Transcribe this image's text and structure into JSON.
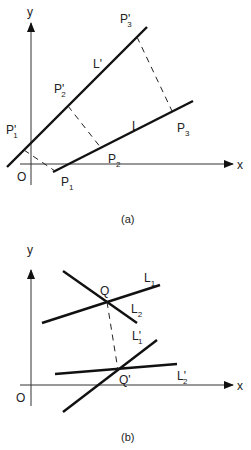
{
  "diagram_a": {
    "caption": "(a)",
    "axis_x_label": "x",
    "axis_y_label": "y",
    "origin_label": "O",
    "lines": [
      {
        "name": "L",
        "label": "L"
      },
      {
        "name": "L_prime",
        "label": "L",
        "prime": "'"
      }
    ],
    "points": [
      {
        "name": "P1",
        "main": "P",
        "sub": "1",
        "prime": ""
      },
      {
        "name": "P2",
        "main": "P",
        "sub": "2",
        "prime": ""
      },
      {
        "name": "P3",
        "main": "P",
        "sub": "3",
        "prime": ""
      },
      {
        "name": "P1_prime",
        "main": "P",
        "sub": "1",
        "prime": "'"
      },
      {
        "name": "P2_prime",
        "main": "P",
        "sub": "2",
        "prime": "'"
      },
      {
        "name": "P3_prime",
        "main": "P",
        "sub": "3",
        "prime": "'"
      }
    ]
  },
  "diagram_b": {
    "caption": "(b)",
    "axis_x_label": "x",
    "axis_y_label": "y",
    "origin_label": "O",
    "lines": [
      {
        "name": "L1",
        "main": "L",
        "sub": "1",
        "prime": ""
      },
      {
        "name": "L2",
        "main": "L",
        "sub": "2",
        "prime": ""
      },
      {
        "name": "L1_prime",
        "main": "L",
        "sub": "1",
        "prime": "'"
      },
      {
        "name": "L2_prime",
        "main": "L",
        "sub": "2",
        "prime": "'"
      }
    ],
    "points": [
      {
        "name": "Q",
        "label": "Q"
      },
      {
        "name": "Q_prime",
        "label": "Q'"
      }
    ]
  }
}
